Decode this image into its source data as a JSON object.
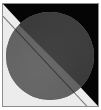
{
  "figure": {
    "caption": "",
    "canvas": {
      "width_px": 101,
      "height_px": 110
    },
    "frame": {
      "border_color": "#8d8d8d",
      "border_width_px": 1,
      "margin_px": 2
    },
    "background": {
      "light_region_color": "#ececec",
      "dark_region_color": "#050505",
      "light_region_position": "lower-left",
      "dark_region_position": "upper-right"
    },
    "circle": {
      "shape": "circle",
      "diameter_px": 88,
      "center_x_px": 49,
      "center_y_px": 55,
      "upper_right_half_color": "#3a3a3a",
      "lower_left_half_color": "#626262"
    },
    "diagonal": {
      "direction": "top-left to bottom-right",
      "angle_degrees": 47,
      "seam_color": "#141414"
    },
    "regions": [
      {
        "name": "background-upper-right",
        "color": "#050505",
        "tone": "black"
      },
      {
        "name": "background-lower-left",
        "color": "#ececec",
        "tone": "near-white"
      },
      {
        "name": "circle-upper-right",
        "color": "#3a3a3a",
        "tone": "dark-gray"
      },
      {
        "name": "circle-lower-left",
        "color": "#626262",
        "tone": "mid-gray"
      }
    ]
  }
}
